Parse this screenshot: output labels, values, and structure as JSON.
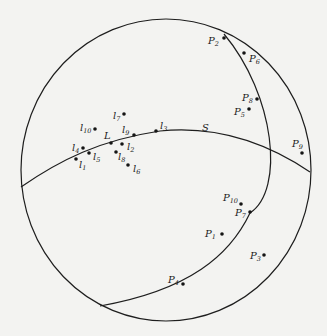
{
  "diagram": {
    "type": "stereographic projection",
    "colors": {
      "line": "#1e1e1e",
      "background": "#f3f3f1"
    },
    "curves": [
      {
        "name": "primitive-circle"
      },
      {
        "name": "great-circle-S",
        "label": "S"
      },
      {
        "name": "great-circle-P"
      }
    ],
    "special_points": [
      {
        "id": "L",
        "label": "L",
        "sub": "",
        "x": 111,
        "y": 143,
        "lx": 104,
        "ly": 139
      }
    ],
    "l_points": [
      {
        "id": "l1",
        "label": "l",
        "sub": "1",
        "x": 76,
        "y": 159,
        "lx": 79,
        "ly": 168
      },
      {
        "id": "l2",
        "label": "l",
        "sub": "2",
        "x": 122,
        "y": 144,
        "lx": 127,
        "ly": 150
      },
      {
        "id": "l3",
        "label": "l",
        "sub": "3",
        "x": 156,
        "y": 131,
        "lx": 160,
        "ly": 129
      },
      {
        "id": "l4",
        "label": "l",
        "sub": "4",
        "x": 83,
        "y": 148,
        "lx": 72,
        "ly": 151
      },
      {
        "id": "l5",
        "label": "l",
        "sub": "5",
        "x": 89,
        "y": 153,
        "lx": 93,
        "ly": 160
      },
      {
        "id": "l6",
        "label": "l",
        "sub": "6",
        "x": 128,
        "y": 165,
        "lx": 133,
        "ly": 172
      },
      {
        "id": "l7",
        "label": "l",
        "sub": "7",
        "x": 124,
        "y": 114,
        "lx": 113,
        "ly": 119
      },
      {
        "id": "l8",
        "label": "l",
        "sub": "8",
        "x": 116,
        "y": 152,
        "lx": 118,
        "ly": 160
      },
      {
        "id": "l9",
        "label": "l",
        "sub": "9",
        "x": 134,
        "y": 135,
        "lx": 122,
        "ly": 133
      },
      {
        "id": "l10",
        "label": "l",
        "sub": "10",
        "x": 95,
        "y": 129,
        "lx": 80,
        "ly": 131
      }
    ],
    "p_points": [
      {
        "id": "P1",
        "label": "P",
        "sub": "1",
        "x": 222,
        "y": 234,
        "lx": 205,
        "ly": 237
      },
      {
        "id": "P2",
        "label": "P",
        "sub": "2",
        "x": 224,
        "y": 38,
        "lx": 208,
        "ly": 44
      },
      {
        "id": "P3",
        "label": "P",
        "sub": "3",
        "x": 264,
        "y": 255,
        "lx": 250,
        "ly": 259
      },
      {
        "id": "P4",
        "label": "P",
        "sub": "4",
        "x": 183,
        "y": 284,
        "lx": 168,
        "ly": 283
      },
      {
        "id": "P5",
        "label": "P",
        "sub": "5",
        "x": 249,
        "y": 109,
        "lx": 234,
        "ly": 115
      },
      {
        "id": "P6",
        "label": "P",
        "sub": "6",
        "x": 244,
        "y": 53,
        "lx": 249,
        "ly": 62
      },
      {
        "id": "P7",
        "label": "P",
        "sub": "7",
        "x": 250,
        "y": 212,
        "lx": 235,
        "ly": 216
      },
      {
        "id": "P8",
        "label": "P",
        "sub": "8",
        "x": 257,
        "y": 99,
        "lx": 242,
        "ly": 101
      },
      {
        "id": "P9",
        "label": "P",
        "sub": "9",
        "x": 302,
        "y": 153,
        "lx": 292,
        "ly": 147
      },
      {
        "id": "P10",
        "label": "P",
        "sub": "10",
        "x": 241,
        "y": 204,
        "lx": 223,
        "ly": 201
      }
    ],
    "S_label": {
      "text": "S",
      "x": 202,
      "y": 131
    }
  }
}
